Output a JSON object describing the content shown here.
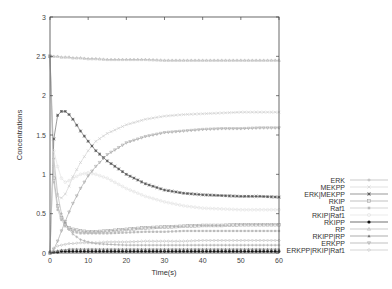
{
  "chart_data": {
    "type": "line",
    "title": "",
    "xlabel": "Time(s)",
    "ylabel": "Concentrations",
    "xlim": [
      0,
      60
    ],
    "ylim": [
      0,
      3
    ],
    "xticks": [
      "0",
      "10",
      "20",
      "30",
      "40",
      "50",
      "60"
    ],
    "yticks": [
      "0",
      "0.5",
      "1",
      "1.5",
      "2",
      "2.5",
      "3"
    ],
    "grid": false,
    "legend_position": "right-bottom-outside",
    "x": [
      0,
      1,
      2,
      3,
      4,
      5,
      6,
      8,
      10,
      12,
      15,
      20,
      25,
      30,
      35,
      40,
      45,
      50,
      55,
      60
    ],
    "series": [
      {
        "name": "ERK",
        "color": "#aaaaaa",
        "marker": "+",
        "values": [
          2.5,
          1.2,
          0.75,
          0.5,
          0.38,
          0.3,
          0.24,
          0.17,
          0.14,
          0.12,
          0.11,
          0.1,
          0.1,
          0.1,
          0.1,
          0.1,
          0.1,
          0.1,
          0.1,
          0.1
        ]
      },
      {
        "name": "MEKPP",
        "color": "#cccccc",
        "marker": "x",
        "values": [
          2.5,
          1.1,
          0.72,
          0.7,
          0.75,
          0.85,
          0.97,
          1.15,
          1.3,
          1.42,
          1.52,
          1.63,
          1.7,
          1.74,
          1.76,
          1.77,
          1.78,
          1.79,
          1.79,
          1.79
        ]
      },
      {
        "name": "ERK|MEKPP",
        "color": "#555555",
        "marker": "*",
        "values": [
          0,
          1.45,
          1.75,
          1.8,
          1.8,
          1.76,
          1.7,
          1.55,
          1.42,
          1.3,
          1.17,
          1.0,
          0.88,
          0.8,
          0.76,
          0.74,
          0.73,
          0.72,
          0.72,
          0.71
        ]
      },
      {
        "name": "RKIP",
        "color": "#999999",
        "marker": "square",
        "values": [
          2.5,
          0.95,
          0.6,
          0.45,
          0.37,
          0.32,
          0.3,
          0.28,
          0.27,
          0.27,
          0.28,
          0.3,
          0.32,
          0.33,
          0.34,
          0.35,
          0.35,
          0.36,
          0.36,
          0.36
        ]
      },
      {
        "name": "Raf1",
        "color": "#bbbbbb",
        "marker": "square-filled",
        "values": [
          2.5,
          0.9,
          0.55,
          0.42,
          0.34,
          0.3,
          0.27,
          0.25,
          0.25,
          0.25,
          0.25,
          0.26,
          0.27,
          0.27,
          0.28,
          0.28,
          0.28,
          0.28,
          0.28,
          0.28
        ]
      },
      {
        "name": "RKIP|Raf1",
        "color": "#dddddd",
        "marker": "circle",
        "values": [
          0,
          1.3,
          1.1,
          0.95,
          0.9,
          0.92,
          0.95,
          1.0,
          1.02,
          1.0,
          0.95,
          0.82,
          0.72,
          0.65,
          0.6,
          0.57,
          0.56,
          0.55,
          0.55,
          0.55
        ]
      },
      {
        "name": "RKIPP",
        "color": "#111111",
        "marker": "circle-filled",
        "values": [
          0,
          0.01,
          0.01,
          0.02,
          0.02,
          0.02,
          0.02,
          0.02,
          0.02,
          0.02,
          0.02,
          0.02,
          0.02,
          0.02,
          0.02,
          0.02,
          0.02,
          0.02,
          0.02,
          0.02
        ]
      },
      {
        "name": "RP",
        "color": "#aaaaaa",
        "marker": "triangle",
        "values": [
          2.5,
          2.5,
          2.5,
          2.49,
          2.49,
          2.49,
          2.48,
          2.48,
          2.47,
          2.47,
          2.46,
          2.46,
          2.46,
          2.45,
          2.45,
          2.45,
          2.45,
          2.45,
          2.45,
          2.45
        ]
      },
      {
        "name": "RKIPP|RP",
        "color": "#777777",
        "marker": "triangle-filled",
        "values": [
          0,
          0.02,
          0.03,
          0.04,
          0.04,
          0.05,
          0.05,
          0.05,
          0.05,
          0.05,
          0.05,
          0.05,
          0.05,
          0.05,
          0.05,
          0.05,
          0.05,
          0.05,
          0.05,
          0.05
        ]
      },
      {
        "name": "ERKPP",
        "color": "#999999",
        "marker": "triangle-down",
        "values": [
          0,
          0.05,
          0.15,
          0.28,
          0.4,
          0.52,
          0.63,
          0.82,
          0.98,
          1.1,
          1.25,
          1.4,
          1.48,
          1.53,
          1.55,
          1.57,
          1.58,
          1.58,
          1.59,
          1.59
        ]
      },
      {
        "name": "ERKPP|RKIP|Raf1",
        "color": "#bbbbbb",
        "marker": "diamond",
        "values": [
          0,
          0.06,
          0.09,
          0.1,
          0.11,
          0.12,
          0.12,
          0.13,
          0.13,
          0.13,
          0.14,
          0.14,
          0.15,
          0.15,
          0.15,
          0.16,
          0.16,
          0.16,
          0.16,
          0.16
        ]
      }
    ]
  }
}
